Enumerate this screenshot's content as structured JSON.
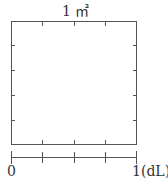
{
  "diagram": {
    "area_label": "1 ㎡",
    "scale": {
      "start_label": "0",
      "end_label": "1",
      "unit_label": "(dL)",
      "divisions": 4
    },
    "square": {
      "divisions_per_side": 4,
      "vertical_divisions": 5
    },
    "colors": {
      "line": "#555555",
      "text": "#333333",
      "background": "#ffffff"
    }
  }
}
